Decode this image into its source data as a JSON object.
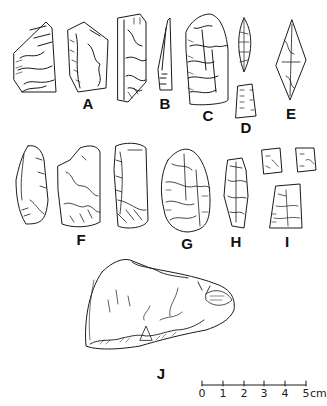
{
  "figure": {
    "background": "#ffffff",
    "ink_color": "#1a1a1a",
    "artifact_labels": {
      "A": "A",
      "B": "B",
      "C": "C",
      "D": "D",
      "E": "E",
      "F": "F",
      "G": "G",
      "H": "H",
      "I": "I",
      "J": "J"
    },
    "scale_bar": {
      "ticks": [
        "0",
        "1",
        "2",
        "3",
        "4",
        "5"
      ],
      "unit": "cm"
    }
  }
}
